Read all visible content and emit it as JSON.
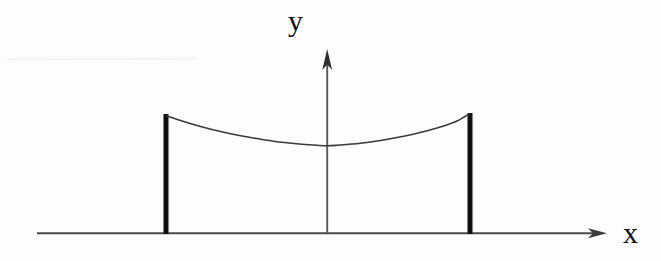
{
  "figure": {
    "kind": "math-diagram",
    "background_color": "#fdfdfd",
    "ink_color": "#202020",
    "axis_color": "#555555",
    "post_color": "#101010"
  },
  "axes": {
    "x_axis": {
      "label": "x",
      "y_pixel": 233,
      "x_start": 37,
      "x_end": 607,
      "arrow": "right",
      "arrow_name": "x-axis-arrowhead"
    },
    "y_axis": {
      "label": "y",
      "x_pixel": 327,
      "y_start": 233,
      "y_end": 50,
      "arrow": "up",
      "arrow_name": "y-axis-arrowhead"
    }
  },
  "chart_data": {
    "type": "line",
    "title": "",
    "subtitle": "",
    "xlabel": "x",
    "ylabel": "y",
    "grid": false,
    "legend": null,
    "axis_origin_px": [
      327,
      233
    ],
    "xlim_px": [
      37,
      607
    ],
    "ylim_px": [
      233,
      50
    ],
    "series": [
      {
        "name": "catenary",
        "comment": "y values are pixel rows (smaller = higher on screen)",
        "x": [
          167,
          182,
          197,
          212,
          227,
          242,
          257,
          272,
          287,
          302,
          317,
          327,
          337,
          352,
          367,
          382,
          397,
          412,
          427,
          442,
          457,
          469
        ],
        "y": [
          116,
          121,
          125.5,
          129.5,
          133,
          136,
          138.6,
          141,
          142.8,
          144.2,
          145.3,
          145.8,
          145.3,
          144.0,
          142.4,
          140.2,
          137.6,
          134.4,
          130.8,
          126.6,
          121.0,
          114
        ]
      }
    ],
    "markers": [
      {
        "name": "left-post",
        "x_px": 166,
        "y_top_px": 114,
        "y_bottom_px": 234,
        "width_px": 5
      },
      {
        "name": "right-post",
        "x_px": 470,
        "y_top_px": 113,
        "y_bottom_px": 234,
        "width_px": 5
      }
    ],
    "annotations": [
      {
        "name": "y-axis-label",
        "text": "y",
        "x_px": 298,
        "y_px": 22
      },
      {
        "name": "x-axis-label",
        "text": "x",
        "x_px": 633,
        "y_px": 234
      }
    ],
    "vertex": {
      "x_px": 327,
      "y_px": 146
    }
  },
  "artifacts": {
    "scan_streak": {
      "name": "scan-streak",
      "x_start": 0,
      "x_end": 200,
      "y_pixel": 59,
      "color": "#f2f2f2"
    }
  }
}
